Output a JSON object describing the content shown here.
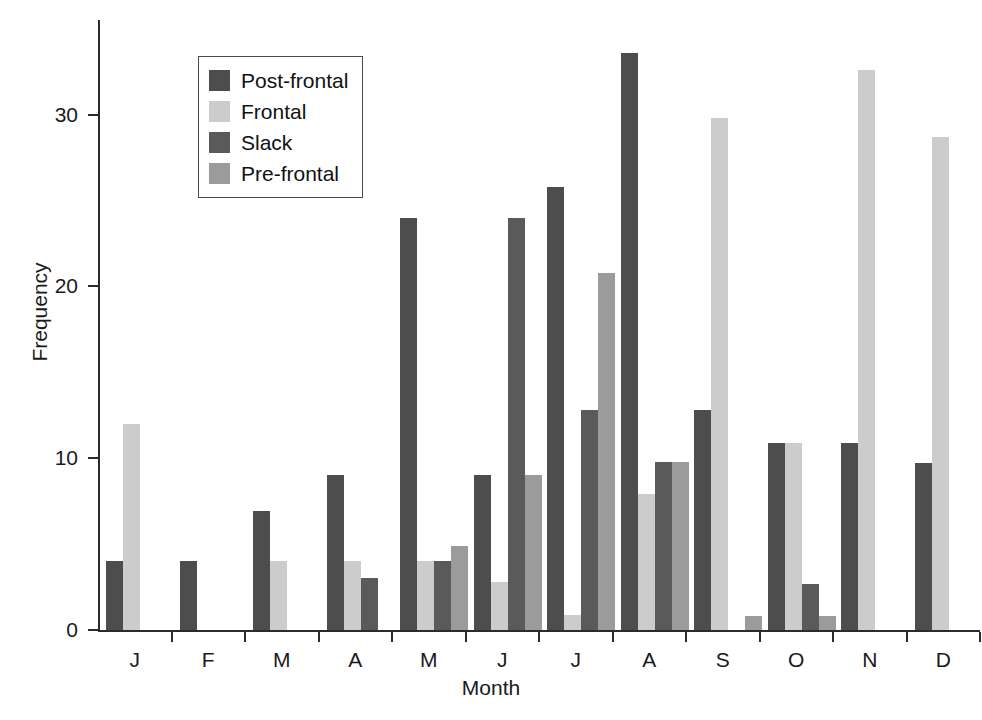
{
  "chart_data": {
    "type": "bar",
    "title": "",
    "xlabel": "Month",
    "ylabel": "Frequency",
    "categories": [
      "J",
      "F",
      "M",
      "A",
      "M",
      "J",
      "J",
      "A",
      "S",
      "O",
      "N",
      "D"
    ],
    "ylim": [
      0,
      35.5
    ],
    "yticks": [
      0,
      10,
      20,
      30
    ],
    "ytick_labels": [
      "0",
      "10",
      "20",
      "30"
    ],
    "grid": false,
    "legend_position": "upper-left-inside",
    "series": [
      {
        "name": "Post-frontal",
        "color": "#4d4d4d",
        "values": [
          4.0,
          4.0,
          6.9,
          9.0,
          24.0,
          9.0,
          25.8,
          33.6,
          12.8,
          10.9,
          10.9,
          9.7
        ]
      },
      {
        "name": "Frontal",
        "color": "#cccccc",
        "values": [
          12.0,
          0,
          4.0,
          4.0,
          4.0,
          2.8,
          0.9,
          7.9,
          29.8,
          10.9,
          32.6,
          28.7
        ]
      },
      {
        "name": "Slack",
        "color": "#5a5a5a",
        "values": [
          0,
          0,
          0,
          3.0,
          4.0,
          24.0,
          12.8,
          9.8,
          0,
          2.7,
          0,
          0
        ]
      },
      {
        "name": "Pre-frontal",
        "color": "#9b9b9b",
        "values": [
          0,
          0,
          0,
          0,
          4.9,
          9.0,
          20.8,
          9.8,
          0.8,
          0.8,
          0,
          0
        ]
      }
    ]
  },
  "legend": {
    "items": [
      {
        "label": "Post-frontal",
        "color": "#4d4d4d"
      },
      {
        "label": "Frontal",
        "color": "#cccccc"
      },
      {
        "label": "Slack",
        "color": "#5a5a5a"
      },
      {
        "label": "Pre-frontal",
        "color": "#9b9b9b"
      }
    ]
  },
  "axes": {
    "y_label": "Frequency",
    "x_label": "Month"
  }
}
